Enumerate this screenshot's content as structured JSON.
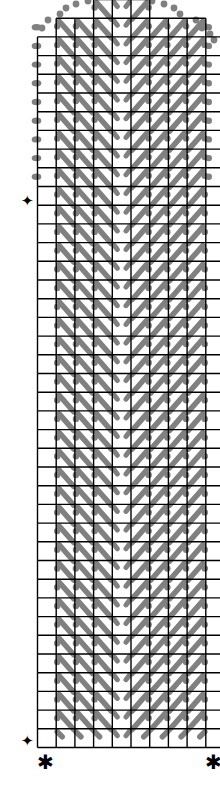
{
  "chart": {
    "type": "stitch-chart",
    "grid": {
      "origin_x": 37.5,
      "origin_y": -0.5,
      "cell": 18.7,
      "columns": 10,
      "rows": 40,
      "top_rows": [
        {
          "row": 0,
          "col_start": 3,
          "col_end": 6
        },
        {
          "row": 1,
          "col_start": 1,
          "col_end": 9
        }
      ],
      "line_color": "#000000",
      "line_width": 1.4
    },
    "stitches": {
      "color": "#808080",
      "left_half_direction": "backslash",
      "right_half_direction": "slash",
      "left_cols": [
        1,
        2,
        3
      ],
      "center_col": 4,
      "right_cols": [
        5,
        6,
        7,
        8
      ],
      "edge_dot_rows_left": [
        1,
        2,
        3,
        4,
        5,
        6,
        7,
        8,
        9
      ],
      "edge_dot_rows_right": [
        1,
        2,
        3,
        4,
        5,
        6,
        7,
        8,
        9
      ]
    },
    "markers": {
      "diamond_symbol": "✦",
      "asterisk_symbol": "✱",
      "diamond_top_label": "✦",
      "diamond_bottom_label": "✦",
      "asterisk_left_label": "✱",
      "asterisk_right_label": "✱"
    }
  }
}
